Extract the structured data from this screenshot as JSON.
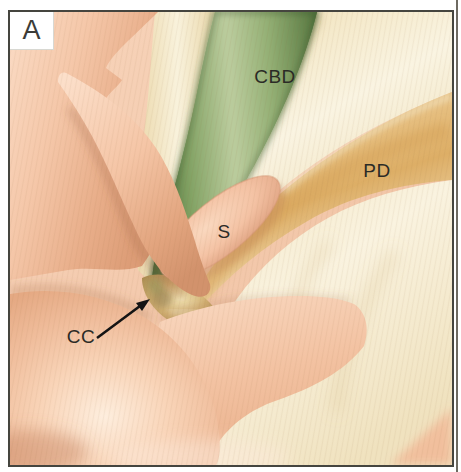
{
  "panel": {
    "letter": "A"
  },
  "labels": {
    "common_bile_duct": "CBD",
    "pancreatic_duct": "PD",
    "septum": "S",
    "common_channel": "CC"
  },
  "colors": {
    "bile_duct_green": "#8ba56c",
    "pancreatic_duct_tan": "#e0b372",
    "tissue_pink": "#f5c7a9",
    "duct_wall_cream": "#f7efd9",
    "common_channel_gold": "#cfae6f",
    "frame_border": "#45453f",
    "label_text": "#2b2b26",
    "background": "#ffffff"
  }
}
